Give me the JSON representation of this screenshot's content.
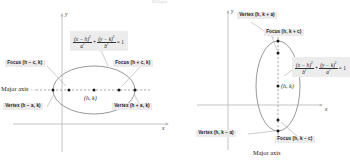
{
  "figure": {
    "top_clipped_text": "Ellipse",
    "background": "#ffffff",
    "curve_color": "#8a8a8a",
    "axis_color": "#b9b9b9",
    "dash_color": "#9a8f8f",
    "label_bg": "#eceaea",
    "point_color": "#1a1a1a"
  },
  "left_panel": {
    "name": "horizontal-major-axis-ellipse",
    "axis_x_label": "x",
    "axis_y_label": "y",
    "center_label": "(h, k)",
    "major_axis_label": "Major axis",
    "focus_left": "Focus (h − c, k)",
    "focus_right": "Focus (h + c, k)",
    "vertex_left": "Vertex (h − a, k)",
    "vertex_right": "Vertex (h + a, k)",
    "equation": {
      "term1_num": "(x − h)",
      "term1_num_exp": "2",
      "term1_den": "a",
      "term1_den_exp": "2",
      "plus": "+",
      "term2_num": "(y − k)",
      "term2_num_exp": "2",
      "term2_den": "b",
      "term2_den_exp": "2",
      "equals": "= 1"
    }
  },
  "right_panel": {
    "name": "vertical-major-axis-ellipse",
    "axis_x_label": "x",
    "axis_y_label": "y",
    "center_label": "(h, k)",
    "major_axis_label": "Major axis",
    "vertex_top": "Vertex (h, k + a)",
    "focus_top": "Focus (h, k + c)",
    "vertex_bottom": "Vertex (h, k − a)",
    "focus_bottom": "Focus (h, k − c)",
    "equation": {
      "term1_num": "(x − h)",
      "term1_num_exp": "2",
      "term1_den": "b",
      "term1_den_exp": "2",
      "plus": "+",
      "term2_num": "(y − k)",
      "term2_num_exp": "2",
      "term2_den": "a",
      "term2_den_exp": "2",
      "equals": "= 1"
    }
  }
}
